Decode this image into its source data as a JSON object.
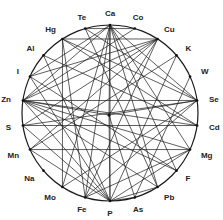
{
  "diagram": {
    "type": "circular-interaction-network",
    "nodes": [
      "Ca",
      "Co",
      "Cu",
      "K",
      "W",
      "Se",
      "Cd",
      "Mg",
      "F",
      "Pb",
      "As",
      "P",
      "Fe",
      "Mo",
      "Na",
      "Mn",
      "S",
      "Zn",
      "I",
      "Al",
      "Hg",
      "Te"
    ],
    "center_node": "center",
    "edges": [
      [
        "Ca",
        "P"
      ],
      [
        "Ca",
        "center"
      ],
      [
        "Ca",
        "Mo"
      ],
      [
        "Ca",
        "Fe"
      ],
      [
        "Ca",
        "Pb"
      ],
      [
        "Ca",
        "F"
      ],
      [
        "Ca",
        "Zn"
      ],
      [
        "Ca",
        "Mg"
      ],
      [
        "Ca",
        "Se"
      ],
      [
        "Ca",
        "I"
      ],
      [
        "Hg",
        "Cu"
      ],
      [
        "Hg",
        "Se"
      ],
      [
        "Hg",
        "Cd"
      ],
      [
        "Hg",
        "Mo"
      ],
      [
        "Hg",
        "Fe"
      ],
      [
        "Cu",
        "Zn"
      ],
      [
        "Cu",
        "S"
      ],
      [
        "Cu",
        "I"
      ],
      [
        "Cu",
        "Mn"
      ],
      [
        "Cu",
        "Fe"
      ],
      [
        "Cu",
        "center"
      ],
      [
        "Co",
        "Zn"
      ],
      [
        "Co",
        "Te"
      ],
      [
        "Zn",
        "Cd"
      ],
      [
        "Zn",
        "Se"
      ],
      [
        "Zn",
        "center"
      ],
      [
        "Zn",
        "P"
      ],
      [
        "Zn",
        "Mg"
      ],
      [
        "Zn",
        "F"
      ],
      [
        "Zn",
        "Pb"
      ],
      [
        "K",
        "P"
      ],
      [
        "K",
        "Mn"
      ],
      [
        "W",
        "As"
      ],
      [
        "Se",
        "S"
      ],
      [
        "Se",
        "Fe"
      ],
      [
        "Cd",
        "S"
      ],
      [
        "Mg",
        "Mn"
      ],
      [
        "Mg",
        "P"
      ],
      [
        "Pb",
        "P"
      ],
      [
        "As",
        "P"
      ],
      [
        "F",
        "I"
      ],
      [
        "Te",
        "Pb"
      ],
      [
        "Al",
        "P"
      ],
      [
        "I",
        "P"
      ],
      [
        "Mn",
        "P"
      ],
      [
        "S",
        "P"
      ],
      [
        "Te",
        "Se"
      ],
      [
        "Al",
        "Cd"
      ],
      [
        "Fe",
        "Mg"
      ],
      [
        "Mo",
        "Se"
      ],
      [
        "center",
        "P"
      ],
      [
        "center",
        "Se"
      ],
      [
        "center",
        "As"
      ]
    ]
  }
}
